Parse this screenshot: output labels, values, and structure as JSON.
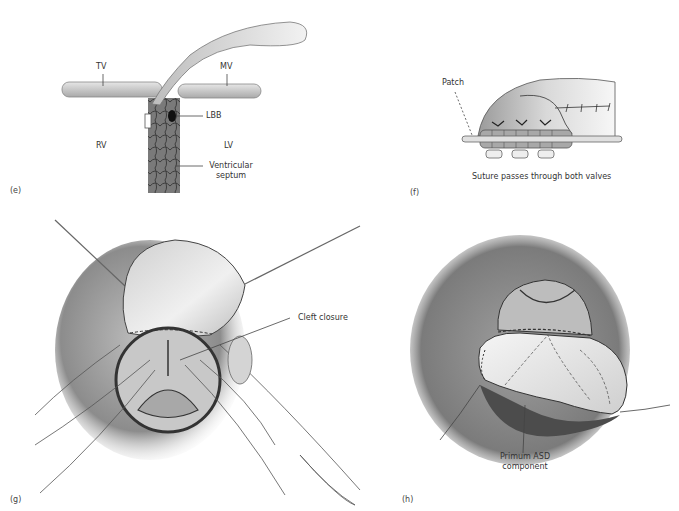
{
  "figure": {
    "panels": [
      {
        "id": "e",
        "panel_label": "(e)",
        "labels": {
          "tv": "TV",
          "mv": "MV",
          "lbb": "LBB",
          "rv": "RV",
          "lv": "LV",
          "septum_line1": "Ventricular",
          "septum_line2": "septum"
        }
      },
      {
        "id": "f",
        "panel_label": "(f)",
        "labels": {
          "patch": "Patch",
          "caption": "Suture passes through both valves"
        }
      },
      {
        "id": "g",
        "panel_label": "(g)",
        "labels": {
          "cleft": "Cleft closure"
        }
      },
      {
        "id": "h",
        "panel_label": "(h)",
        "labels": {
          "primum_line1": "Primum ASD",
          "primum_line2": "component",
          "signature": "RDuke-W"
        }
      }
    ]
  }
}
